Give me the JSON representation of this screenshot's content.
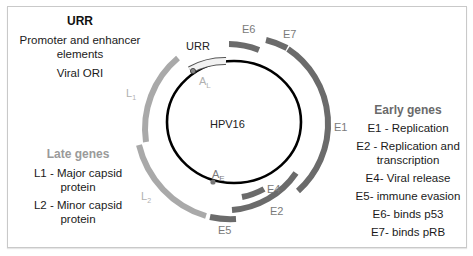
{
  "urr_panel": {
    "title": "URR",
    "items": [
      "Promoter and enhancer elements",
      "Viral ORI"
    ]
  },
  "late_panel": {
    "title": "Late genes",
    "items": [
      "L1 - Major capsid protein",
      "L2 - Minor capsid protein"
    ]
  },
  "early_panel": {
    "title": "Early genes",
    "items": [
      "E1 - Replication",
      "E2 - Replication and transcription",
      "E4- Viral release",
      "E5- immune evasion",
      "E6- binds p53",
      "E7- binds pRB"
    ]
  },
  "diagram": {
    "genome_label": "HPV16",
    "urr_label": "URR",
    "promoter_late": {
      "main": "A",
      "sub": "L"
    },
    "promoter_early": {
      "main": "A",
      "sub": "E"
    },
    "gene_labels": {
      "E6": "E6",
      "E7": "E7",
      "E1": "E1",
      "E2": "E2",
      "E4": "E4",
      "E5": "E5",
      "L1": {
        "main": "L",
        "sub": "1"
      },
      "L2": {
        "main": "L",
        "sub": "2"
      }
    },
    "colors": {
      "early": "#6b6b6b",
      "late": "#a9a9a9",
      "genome": "#000000",
      "urr_fill": "#f2f2f2"
    }
  }
}
